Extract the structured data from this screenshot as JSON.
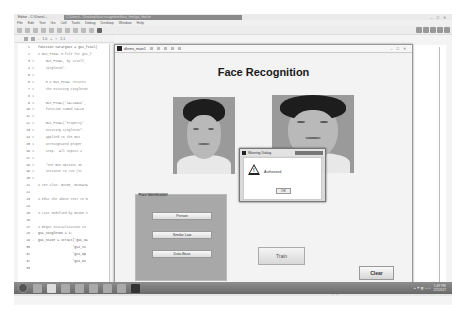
{
  "editor": {
    "app_title": "Editor - C:\\Users\\...",
    "path": "C:\\Users\\...\\Desktop\\face recognition\\face_hmi\\gui_final.m",
    "window_controls": [
      "–",
      "□",
      "✕"
    ],
    "menu": [
      "File",
      "Edit",
      "Text",
      "Go",
      "Cell",
      "Tools",
      "Debug",
      "Desktop",
      "Window",
      "Help"
    ],
    "zoom_controls": {
      "minus": "-",
      "value1": "1.0",
      "plus": "+",
      "divide": "÷",
      "value2": "1.1"
    },
    "code_lines": [
      {
        "n": "1",
        "mark": "",
        "text": "function varargout = gui_final(",
        "comment": false
      },
      {
        "n": "2",
        "mark": "",
        "text": "% GUI_FINAL M-file for gui_f",
        "comment": true
      },
      {
        "n": "3",
        "mark": "%",
        "text": "    GUI_FINAL, by itself,",
        "comment": true
      },
      {
        "n": "4",
        "mark": "%",
        "text": "    singleton*.",
        "comment": true
      },
      {
        "n": "5",
        "mark": "%",
        "text": "",
        "comment": true
      },
      {
        "n": "6",
        "mark": "%",
        "text": "    H = GUI_FINAL returns",
        "comment": true
      },
      {
        "n": "7",
        "mark": "%",
        "text": "    the existing singleton",
        "comment": true
      },
      {
        "n": "8",
        "mark": "%",
        "text": "",
        "comment": true
      },
      {
        "n": "9",
        "mark": "%",
        "text": "    GUI_FINAL('CALLBACK',",
        "comment": true
      },
      {
        "n": "10",
        "mark": "%",
        "text": "    function named CALLB",
        "comment": true
      },
      {
        "n": "11",
        "mark": "%",
        "text": "",
        "comment": true
      },
      {
        "n": "12",
        "mark": "%",
        "text": "    GUI_FINAL('Property'",
        "comment": true
      },
      {
        "n": "13",
        "mark": "%",
        "text": "    existing singleton*.",
        "comment": true
      },
      {
        "n": "14",
        "mark": "%",
        "text": "    applied to the GUI",
        "comment": true
      },
      {
        "n": "15",
        "mark": "%",
        "text": "    unrecognized proper",
        "comment": true
      },
      {
        "n": "16",
        "mark": "%",
        "text": "    stop.  All inputs a",
        "comment": true
      },
      {
        "n": "17",
        "mark": "%",
        "text": "",
        "comment": true
      },
      {
        "n": "18",
        "mark": "%",
        "text": "    *See GUI Options on",
        "comment": true
      },
      {
        "n": "19",
        "mark": "%",
        "text": "    instance to run (si",
        "comment": true
      },
      {
        "n": "20",
        "mark": "%",
        "text": "",
        "comment": true
      },
      {
        "n": "21",
        "mark": "",
        "text": "% See also: GUIDE, GUIDATA",
        "comment": true
      },
      {
        "n": "22",
        "mark": "",
        "text": "",
        "comment": false
      },
      {
        "n": "23",
        "mark": "",
        "text": "% Edit the above text to m",
        "comment": true
      },
      {
        "n": "24",
        "mark": "",
        "text": "",
        "comment": false
      },
      {
        "n": "25",
        "mark": "",
        "text": "% Last Modified by GUIDE v",
        "comment": true
      },
      {
        "n": "26",
        "mark": "",
        "text": "",
        "comment": false
      },
      {
        "n": "27",
        "mark": "",
        "text": "% Begin initialization co",
        "comment": true
      },
      {
        "n": "28",
        "mark": "-",
        "text": "gui_Singleton = 1;",
        "comment": false
      },
      {
        "n": "29",
        "mark": "-",
        "text": "gui_State = struct('gui_Na",
        "comment": false
      },
      {
        "n": "30",
        "mark": "",
        "text": "                  'gui_Si",
        "comment": false
      },
      {
        "n": "31",
        "mark": "",
        "text": "                  'gui_Op",
        "comment": false
      },
      {
        "n": "32",
        "mark": "",
        "text": "                  'gui_Ou",
        "comment": false
      },
      {
        "n": "33",
        "mark": "",
        "text": "",
        "comment": false
      }
    ],
    "file_tabs": [
      {
        "label": "dhrmx_main.m",
        "active": false
      },
      {
        "label": "gui_final.m",
        "active": true
      }
    ],
    "status": {
      "function": "gui_final",
      "ln_label": "Ln 1",
      "col_label": "Col 1",
      "mode": "OVR"
    }
  },
  "figure": {
    "window_title": "dhrmx_main1",
    "window_controls": [
      "–",
      "□",
      "✕"
    ],
    "heading": "Face Recognition",
    "panel": {
      "title": "Face Identification",
      "buttons": [
        "Person",
        "Similar Law",
        "Data Base"
      ]
    },
    "train_label": "Train",
    "clear_label": "Clear"
  },
  "dialog": {
    "title": "Warning Dialog",
    "message": "Authorized",
    "ok_label": "OK",
    "warn_mark": "!"
  },
  "taskbar": {
    "tray_icons": "▴ ⚑ ◧ ▭ ◐",
    "time": "1:49 PM",
    "date": "2/2/2017"
  }
}
